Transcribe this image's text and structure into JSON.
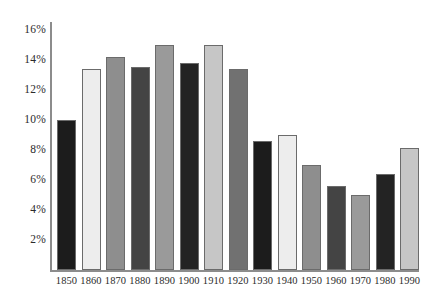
{
  "chart_data": {
    "type": "bar",
    "title": "",
    "subtitle": "",
    "xlabel": "",
    "ylabel": "",
    "categories": [
      "1850",
      "1860",
      "1870",
      "1880",
      "1890",
      "1900",
      "1910",
      "1920",
      "1930",
      "1940",
      "1950",
      "1960",
      "1970",
      "1980",
      "1990"
    ],
    "values": [
      10.0,
      13.4,
      14.2,
      13.5,
      15.0,
      13.8,
      15.0,
      13.4,
      8.6,
      9.0,
      7.0,
      5.6,
      5.0,
      6.4,
      8.1
    ],
    "value_suffix": "%",
    "ylim": [
      0,
      16.5
    ],
    "ytick_values": [
      2,
      4,
      6,
      8,
      10,
      12,
      14,
      16
    ],
    "ytick_labels": [
      "2%",
      "4%",
      "6%",
      "8%",
      "10%",
      "12%",
      "14%",
      "16%"
    ],
    "grid": false,
    "legend": null,
    "legend_position": "none",
    "bar_colors": [
      "#1c1c1c",
      "#ededed",
      "#8e8e8e",
      "#444444",
      "#9a9a9a",
      "#232323",
      "#c6c6c6",
      "#717171",
      "#1c1c1c",
      "#ededed",
      "#8e8e8e",
      "#444444",
      "#9a9a9a",
      "#232323",
      "#c6c6c6"
    ],
    "bar_border_color": "#6b6b6b",
    "axis_color": "#8c8c8c",
    "text_color": "#2b2b2b",
    "background_color": "#ffffff"
  }
}
